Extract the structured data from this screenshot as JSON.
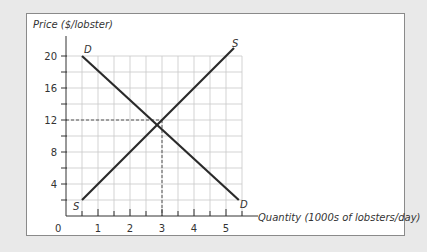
{
  "chart_data": {
    "type": "line",
    "title": "",
    "ylabel": "Price ($/lobster)",
    "xlabel": "Quantity (1000s of lobsters/day)",
    "x_ticks": [
      "0",
      "1",
      "2",
      "3",
      "4",
      "5"
    ],
    "y_ticks": [
      "4",
      "8",
      "12",
      "16",
      "20"
    ],
    "xlim": [
      0,
      5.5
    ],
    "ylim": [
      0,
      22
    ],
    "grid": true,
    "legend": "none",
    "series": [
      {
        "name": "D",
        "label": "D",
        "x": [
          0.5,
          5.4
        ],
        "y": [
          20,
          2
        ]
      },
      {
        "name": "S",
        "label": "S",
        "x": [
          0.5,
          5.25
        ],
        "y": [
          2,
          21
        ]
      }
    ],
    "equilibrium": {
      "quantity": 3,
      "price": 12
    },
    "annotations": [
      "D",
      "S",
      "D",
      "S"
    ]
  },
  "labels": {
    "y_axis": "Price ($/lobster)",
    "x_axis": "Quantity (1000s of lobsters/day)",
    "origin": "0",
    "demand": "D",
    "supply": "S"
  }
}
